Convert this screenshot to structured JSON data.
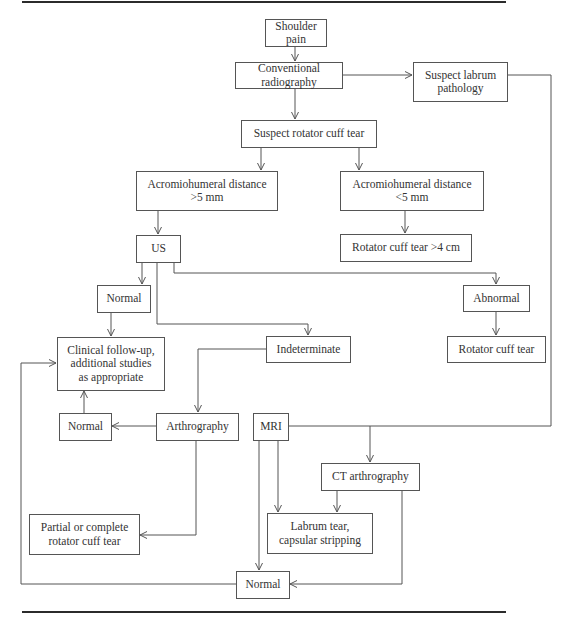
{
  "diagram": {
    "type": "flowchart",
    "topic": "Imaging workup of shoulder pain",
    "nodes": {
      "shoulder_pain": "Shoulder pain",
      "conventional_radiography": "Conventional radiography",
      "suspect_labrum": "Suspect labrum\npathology",
      "suspect_rotator_cuff": "Suspect rotator cuff tear",
      "ahd_gt5": "Acromiohumeral distance\n>5 mm",
      "ahd_lt5": "Acromiohumeral distance\n<5 mm",
      "rct_gt4": "Rotator cuff tear >4 cm",
      "us": "US",
      "us_normal": "Normal",
      "us_abnormal": "Abnormal",
      "clinical_followup": "Clinical follow-up,\nadditional studies\nas appropriate",
      "indeterminate": "Indeterminate",
      "rotator_cuff_tear": "Rotator cuff tear",
      "arthro_normal": "Normal",
      "arthrography": "Arthrography",
      "mri": "MRI",
      "ct_arthrography": "CT arthrography",
      "partial_complete": "Partial or complete\nrotator cuff tear",
      "labrum_tear": "Labrum tear,\ncapsular stripping",
      "mri_normal": "Normal"
    },
    "edges": [
      [
        "shoulder_pain",
        "conventional_radiography"
      ],
      [
        "conventional_radiography",
        "suspect_labrum"
      ],
      [
        "conventional_radiography",
        "suspect_rotator_cuff"
      ],
      [
        "suspect_rotator_cuff",
        "ahd_gt5"
      ],
      [
        "suspect_rotator_cuff",
        "ahd_lt5"
      ],
      [
        "ahd_lt5",
        "rct_gt4"
      ],
      [
        "ahd_gt5",
        "us"
      ],
      [
        "us",
        "us_normal"
      ],
      [
        "us",
        "indeterminate"
      ],
      [
        "us",
        "us_abnormal"
      ],
      [
        "us_abnormal",
        "rotator_cuff_tear"
      ],
      [
        "us_normal",
        "clinical_followup"
      ],
      [
        "indeterminate",
        "arthrography"
      ],
      [
        "arthrography",
        "arthro_normal"
      ],
      [
        "arthro_normal",
        "clinical_followup"
      ],
      [
        "arthrography",
        "partial_complete"
      ],
      [
        "suspect_labrum",
        "mri"
      ],
      [
        "suspect_labrum",
        "ct_arthrography"
      ],
      [
        "mri",
        "labrum_tear"
      ],
      [
        "mri",
        "mri_normal"
      ],
      [
        "ct_arthrography",
        "labrum_tear"
      ],
      [
        "ct_arthrography",
        "mri_normal"
      ],
      [
        "mri_normal",
        "clinical_followup"
      ]
    ]
  },
  "colors": {
    "line": "#555555",
    "rule": "#2b2b2b",
    "text": "#333333"
  }
}
